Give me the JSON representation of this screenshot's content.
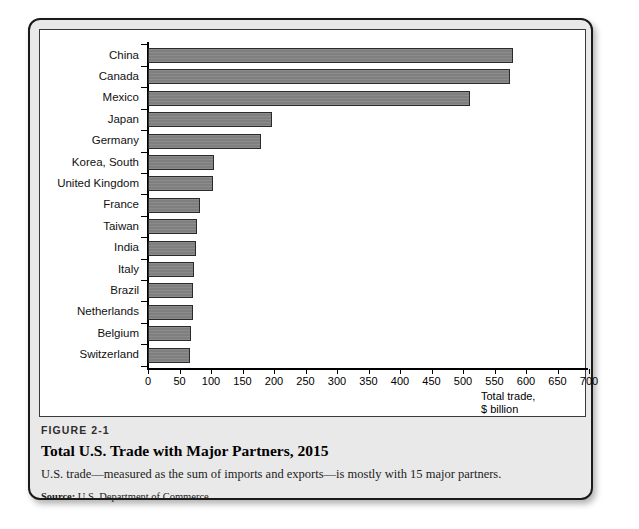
{
  "figure": {
    "number": "FIGURE 2-1",
    "title": "Total U.S. Trade with Major Partners, 2015",
    "description": "U.S. trade—measured as the sum of imports and exports—is mostly with 15 major partners.",
    "source_label": "Source:",
    "source_text": "U.S. Department of Commerce."
  },
  "axis_unit_line1": "Total trade,",
  "axis_unit_line2": "$ billion",
  "chart_data": {
    "type": "bar",
    "orientation": "horizontal",
    "title": "Total U.S. Trade with Major Partners, 2015",
    "xlabel": "Total trade, $ billion",
    "ylabel": "",
    "xlim": [
      0,
      700
    ],
    "xticks": [
      0,
      50,
      100,
      150,
      200,
      250,
      300,
      350,
      400,
      450,
      500,
      550,
      600,
      650,
      700
    ],
    "xtick_labels": [
      "0",
      "50",
      "100",
      "150",
      "200",
      "250",
      "300",
      "350",
      "400",
      "450",
      "500",
      "550",
      "600",
      "650",
      "700"
    ],
    "grid": false,
    "legend": false,
    "bar_color": "#7f7f7f",
    "bar_edge_color": "#2b2b2b",
    "categories": [
      "China",
      "Canada",
      "Mexico",
      "Japan",
      "Germany",
      "Korea, South",
      "United Kingdom",
      "France",
      "Taiwan",
      "India",
      "Italy",
      "Brazil",
      "Netherlands",
      "Belgium",
      "Switzerland"
    ],
    "values": [
      580,
      575,
      511,
      197,
      180,
      105,
      103,
      82,
      78,
      76,
      73,
      72,
      71,
      68,
      67
    ]
  }
}
